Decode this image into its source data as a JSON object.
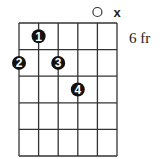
{
  "chord_diagram": {
    "fret_label": "6 fr",
    "strings": 6,
    "frets": 5,
    "grid": {
      "left": 19,
      "top": 23,
      "right": 117,
      "bottom": 156
    },
    "string_markers": [
      {
        "string": 5,
        "type": "open",
        "symbol": "○"
      },
      {
        "string": 6,
        "type": "muted",
        "symbol": "X"
      }
    ],
    "fingers": [
      {
        "finger": "1",
        "string": 2,
        "fret": 1
      },
      {
        "finger": "2",
        "string": 1,
        "fret": 2
      },
      {
        "finger": "3",
        "string": 3,
        "fret": 2
      },
      {
        "finger": "4",
        "string": 4,
        "fret": 3
      }
    ],
    "colors": {
      "line": "#333333",
      "dot": "#111111",
      "dot_text": "#ffffff"
    }
  }
}
